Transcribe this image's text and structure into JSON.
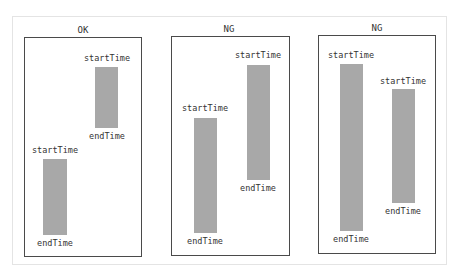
{
  "diagram": {
    "panels": [
      {
        "title": "OK",
        "box": {
          "left": 24,
          "top": 37,
          "width": 118,
          "height": 220
        },
        "intervals": [
          {
            "start_label": "startTime",
            "end_label": "endTime",
            "bar": {
              "left": 95,
              "top": 67,
              "width": 23,
              "height": 61
            }
          },
          {
            "start_label": "startTime",
            "end_label": "endTime",
            "bar": {
              "left": 43,
              "top": 159,
              "width": 24,
              "height": 76
            }
          }
        ]
      },
      {
        "title": "NG",
        "box": {
          "left": 171,
          "top": 36,
          "width": 119,
          "height": 220
        },
        "intervals": [
          {
            "start_label": "startTime",
            "end_label": "endTime",
            "bar": {
              "left": 194,
              "top": 118,
              "width": 23,
              "height": 115
            }
          },
          {
            "start_label": "startTime",
            "end_label": "endTime",
            "bar": {
              "left": 247,
              "top": 65,
              "width": 23,
              "height": 115
            }
          }
        ]
      },
      {
        "title": "NG",
        "box": {
          "left": 318,
          "top": 35,
          "width": 118,
          "height": 219
        },
        "intervals": [
          {
            "start_label": "startTime",
            "end_label": "endTime",
            "bar": {
              "left": 340,
              "top": 64,
              "width": 23,
              "height": 167
            }
          },
          {
            "start_label": "startTime",
            "end_label": "endTime",
            "bar": {
              "left": 392,
              "top": 89,
              "width": 23,
              "height": 114
            }
          }
        ]
      }
    ],
    "colors": {
      "bar": "#a8a8a8",
      "border": "#4a4a4a",
      "text": "#333333"
    }
  }
}
